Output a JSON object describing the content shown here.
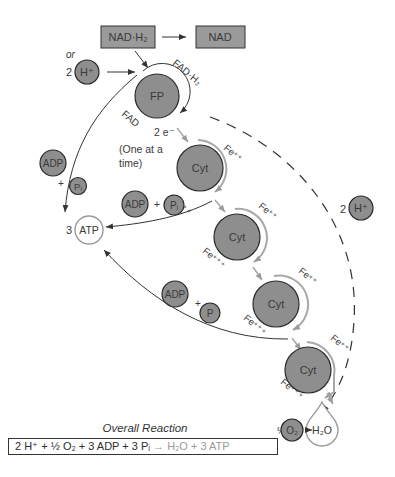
{
  "diagram": {
    "type": "electron-transport-chain",
    "top_boxes": {
      "nadh": "NAD·H₂",
      "nad": "NAD"
    },
    "alt_input": {
      "or_label": "or",
      "h_count": "2",
      "h_label": "H⁺"
    },
    "fp": {
      "label": "FP",
      "fadh_label": "FAD·H₂",
      "fad_label": "FAD"
    },
    "electrons": {
      "label": "2 e⁻",
      "note_line1": "(One at a",
      "note_line2": "time)"
    },
    "cytochromes": [
      {
        "label": "Cyt",
        "fe_in": "Fe⁺⁺",
        "fe_out": "Fe⁺⁺⁺"
      },
      {
        "label": "Cyt",
        "fe_in": "Fe⁺⁺",
        "fe_out": "Fe⁺⁺⁺"
      },
      {
        "label": "Cyt",
        "fe_in": "Fe⁺⁺",
        "fe_out": "Fe⁺⁺⁺"
      },
      {
        "label": "Cyt",
        "fe_in": "Fe⁺⁺",
        "fe_out": "Fe⁺⁺⁺"
      }
    ],
    "phosphorylation_sites": [
      {
        "adp": "ADP",
        "plus": "+",
        "pi": "Pᵢ"
      },
      {
        "adp": "ADP",
        "plus": "+",
        "pi": "Pᵢ"
      },
      {
        "adp": "ADP",
        "plus": "+",
        "pi": "P"
      }
    ],
    "atp": {
      "count": "3",
      "label": "ATP"
    },
    "right_h": {
      "count": "2",
      "label": "H⁺"
    },
    "oxygen": {
      "coef": "½",
      "label": "O₂"
    },
    "water": {
      "label": "H₂O"
    },
    "overall": {
      "title": "Overall Reaction",
      "reactants": "2 H⁺ + ½ O₂ + 3 ADP + 3 Pᵢ",
      "arrow": "→",
      "products": "H₂O + 3 ATP"
    },
    "colors": {
      "circle_fill": "#8e8e8e",
      "circle_stroke": "#2a2a2a",
      "box_fill": "#9a9a9a",
      "arc_gray": "#a8a8a8",
      "line": "#333333"
    }
  }
}
